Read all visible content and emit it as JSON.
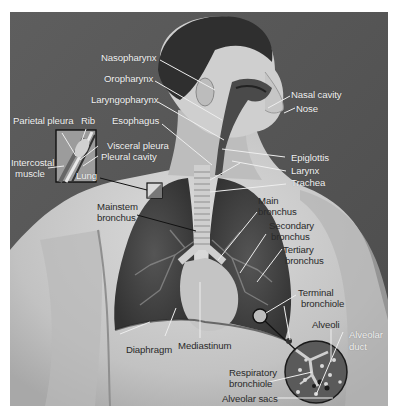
{
  "figure": {
    "colors": {
      "background": "#5a5a5a",
      "skin": "#c9c9c9",
      "lung": "#3f3f3f",
      "label_light": "#f2f2f2",
      "label_dark": "#2a2a2a",
      "leader_line": "#eeeeee"
    }
  },
  "labels": {
    "nasopharynx": "Nasopharynx",
    "oropharynx": "Oropharynx",
    "laryngopharynx": "Laryngopharynx",
    "esophagus": "Esophagus",
    "nasal_cavity": "Nasal cavity",
    "nose": "Nose",
    "epiglottis": "Epiglottis",
    "larynx": "Larynx",
    "trachea": "Trachea",
    "parietal_pleura": "Parietal pleura",
    "rib": "Rib",
    "visceral_pleura": "Visceral pleura",
    "pleural_cavity": "Pleural cavity",
    "intercostal_muscle_1": "Intercostal",
    "intercostal_muscle_2": "muscle",
    "lung": "Lung",
    "mainstem_bronchus_1": "Mainstem",
    "mainstem_bronchus_2": "bronchus",
    "main_bronchus_1": "Main",
    "main_bronchus_2": "bronchus",
    "secondary_bronchus_1": "Secondary",
    "secondary_bronchus_2": "bronchus",
    "tertiary_bronchus_1": "Tertiary",
    "tertiary_bronchus_2": "bronchus",
    "terminal_bronchiole_1": "Terminal",
    "terminal_bronchiole_2": "bronchiole",
    "alveoli": "Alveoli",
    "alveolar_duct_1": "Alveolar",
    "alveolar_duct_2": "duct",
    "respiratory_bronchiole_1": "Respiratory",
    "respiratory_bronchiole_2": "bronchiole",
    "alveolar_sacs": "Alveolar sacs",
    "diaphragm": "Diaphragm",
    "mediastinum": "Mediastinum"
  }
}
